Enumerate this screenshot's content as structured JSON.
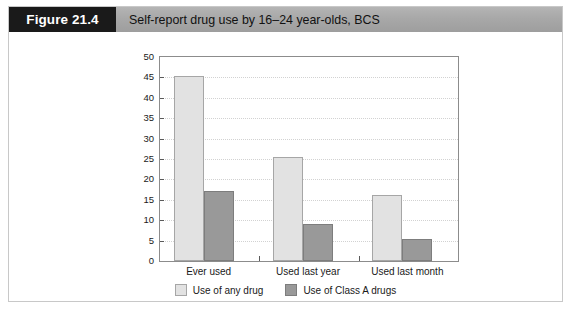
{
  "figure": {
    "number_label": "Figure 21.4",
    "title": "Self-report drug use by 16–24 year-olds, BCS"
  },
  "legend": {
    "position": "bottom-center",
    "entries": [
      {
        "label": "Use of any drug",
        "color": "#e2e2e2",
        "swatch": "light"
      },
      {
        "label": "Use of Class A drugs",
        "color": "#999999",
        "swatch": "dark"
      }
    ]
  },
  "chart_data": {
    "type": "bar",
    "title": "Self-report drug use by 16–24 year-olds, BCS",
    "xlabel": "",
    "ylabel": "Percentage",
    "ylim": [
      0,
      50
    ],
    "yticks": [
      0,
      5,
      10,
      15,
      20,
      25,
      30,
      35,
      40,
      45,
      50
    ],
    "grid": true,
    "categories": [
      "Ever used",
      "Used last year",
      "Used last month"
    ],
    "series": [
      {
        "name": "Use of any drug",
        "color": "#e2e2e2",
        "values": [
          45.3,
          25.4,
          16.1
        ]
      },
      {
        "name": "Use of Class A drugs",
        "color": "#999999",
        "values": [
          17.2,
          9.1,
          5.3
        ]
      }
    ]
  }
}
